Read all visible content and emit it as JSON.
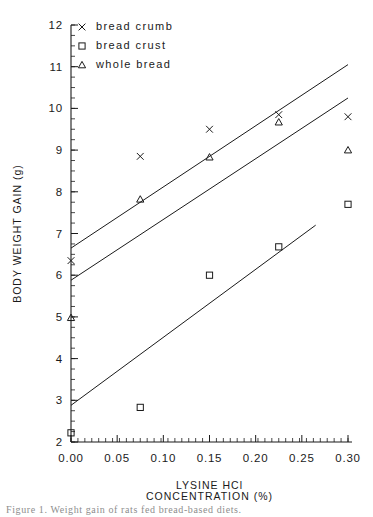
{
  "chart_data": {
    "type": "scatter",
    "title": "",
    "xlabel": "LYSINE  HCl\nCONCENTRATION  (%)",
    "xlabel_line1": "LYSINE   HCl",
    "xlabel_line2": "CONCENTRATION   (%)",
    "ylabel": "BODY WEIGHT GAIN (g)",
    "xlim": [
      0.0,
      0.3
    ],
    "ylim": [
      2,
      12
    ],
    "grid": false,
    "legend_position": "top-left",
    "x_ticks": [
      0.0,
      0.05,
      0.1,
      0.15,
      0.2,
      0.25,
      0.3
    ],
    "x_tick_labels": [
      "0.00",
      "0.05",
      "0.10",
      "0.15",
      "0.20",
      "0.25",
      "0.30"
    ],
    "x_minor_tick_step": 0.0075,
    "y_ticks": [
      2,
      3,
      4,
      5,
      6,
      7,
      8,
      9,
      10,
      11,
      12
    ],
    "y_tick_labels": [
      "2",
      "3",
      "4",
      "5",
      "6",
      "7",
      "8",
      "9",
      "10",
      "11",
      "12"
    ],
    "y_minor_tick_step": 0.25,
    "series": [
      {
        "name": "bread crumb",
        "marker": "x",
        "x": [
          0.0,
          0.075,
          0.15,
          0.225,
          0.3
        ],
        "values": [
          6.35,
          8.85,
          9.5,
          9.85,
          9.8
        ],
        "fit_line": {
          "x0": 0.0,
          "y0": 6.65,
          "x1": 0.3,
          "y1": 11.05
        }
      },
      {
        "name": "bread crust",
        "marker": "square",
        "x": [
          0.0,
          0.075,
          0.15,
          0.225,
          0.3
        ],
        "values": [
          2.22,
          2.83,
          6.0,
          6.68,
          7.7
        ],
        "fit_line": {
          "x0": 0.0,
          "y0": 2.88,
          "x1": 0.265,
          "y1": 7.2
        }
      },
      {
        "name": "whole bread",
        "marker": "triangle",
        "x": [
          0.0,
          0.075,
          0.15,
          0.225,
          0.3
        ],
        "values": [
          4.98,
          7.82,
          8.83,
          9.67,
          9.0
        ],
        "fit_line": {
          "x0": 0.0,
          "y0": 5.88,
          "x1": 0.3,
          "y1": 10.25
        }
      }
    ]
  },
  "legend": {
    "entries": [
      {
        "marker": "x",
        "label": "bread crumb"
      },
      {
        "marker": "square",
        "label": "bread crust"
      },
      {
        "marker": "triangle",
        "label": "whole bread"
      }
    ]
  },
  "axes": {
    "y_title": "BODY WEIGHT GAIN (g)",
    "x_title_line1": "LYSINE   HCl",
    "x_title_line2": "CONCENTRATION   (%)"
  },
  "caption": {
    "text": "Figure 1. Weight gain of rats fed bread-based diets."
  }
}
